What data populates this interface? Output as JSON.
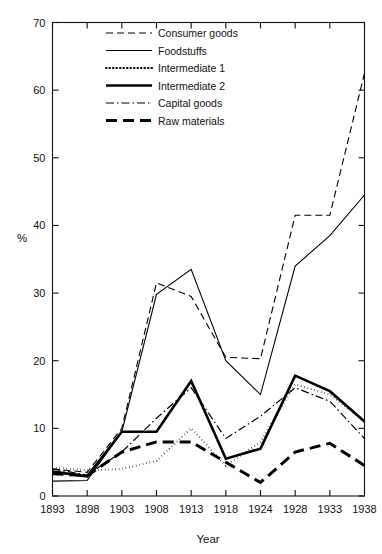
{
  "chart_data": {
    "type": "line",
    "title": "",
    "xlabel": "Year",
    "ylabel": "%",
    "x": [
      1893,
      1898,
      1903,
      1908,
      1913,
      1918,
      1924,
      1928,
      1933,
      1938
    ],
    "xticklabels": [
      "1893",
      "1898",
      "1903",
      "1908",
      "1913",
      "1918",
      "1924",
      "1928",
      "1933",
      "1938"
    ],
    "yticks": [
      0,
      10,
      20,
      30,
      40,
      50,
      60,
      70
    ],
    "yticklabels": [
      "0",
      "10",
      "20",
      "30",
      "40",
      "50",
      "60",
      "70"
    ],
    "ylim": [
      0,
      70
    ],
    "grid": false,
    "legend_position": "upper-left-inside",
    "series": [
      {
        "name": "Consumer goods",
        "style": "dashed",
        "values": [
          4.0,
          3.5,
          10.0,
          31.5,
          29.5,
          20.5,
          20.3,
          41.5,
          41.5,
          62.5
        ]
      },
      {
        "name": "Foodstuffs",
        "style": "solid-thin",
        "values": [
          2.2,
          2.3,
          9.5,
          29.8,
          33.5,
          20.0,
          15.0,
          34.0,
          38.5,
          44.5
        ]
      },
      {
        "name": "Intermediate 1",
        "style": "dotted",
        "values": [
          4.2,
          3.8,
          4.0,
          5.2,
          10.0,
          4.5,
          8.0,
          16.5,
          15.0,
          11.0
        ]
      },
      {
        "name": "Intermediate 2",
        "style": "solid-thick",
        "values": [
          3.6,
          2.9,
          9.5,
          9.5,
          17.0,
          5.5,
          7.0,
          17.8,
          15.5,
          11.0
        ]
      },
      {
        "name": "Capital goods",
        "style": "dash-dot",
        "values": [
          4.0,
          3.1,
          6.5,
          11.5,
          16.0,
          8.5,
          11.8,
          16.0,
          14.0,
          8.5
        ]
      },
      {
        "name": "Raw materials",
        "style": "dashed-thick",
        "values": [
          3.3,
          3.0,
          6.5,
          8.0,
          8.0,
          5.0,
          2.0,
          6.5,
          7.8,
          4.5
        ]
      }
    ]
  },
  "legend": {
    "items": [
      {
        "label": "Consumer goods"
      },
      {
        "label": "Foodstuffs"
      },
      {
        "label": "Intermediate 1"
      },
      {
        "label": "Intermediate 2"
      },
      {
        "label": "Capital goods"
      },
      {
        "label": "Raw materials"
      }
    ]
  },
  "axes": {
    "y_title": "%",
    "x_title": "Year"
  },
  "colors": {
    "ink": "#111111",
    "background": "#ffffff"
  }
}
